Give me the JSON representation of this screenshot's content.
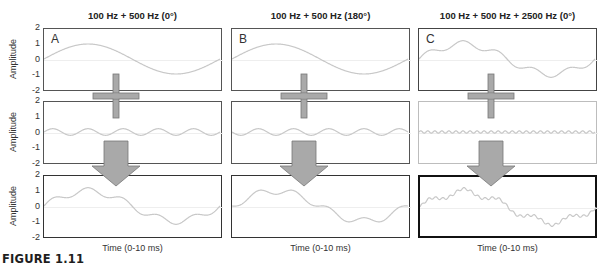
{
  "columns": [
    {
      "title": "100 Hz + 500 Hz (0°)",
      "letter": "A",
      "x_label": "Time (0-10 ms)",
      "rows": [
        {
          "components": [
            {
              "freq": 100,
              "amp": 1.0,
              "phase": 0
            }
          ],
          "border": "#555555"
        },
        {
          "components": [
            {
              "freq": 500,
              "amp": 0.22,
              "phase": 0
            }
          ],
          "border": "#555555"
        },
        {
          "components": [
            {
              "freq": 100,
              "amp": 1.0,
              "phase": 0
            },
            {
              "freq": 500,
              "amp": 0.22,
              "phase": 0
            }
          ],
          "border": "#333333"
        }
      ]
    },
    {
      "title": "100 Hz + 500 Hz (180°)",
      "letter": "B",
      "x_label": "Time (0-10 ms)",
      "rows": [
        {
          "components": [
            {
              "freq": 100,
              "amp": 1.0,
              "phase": 0
            }
          ],
          "border": "#555555"
        },
        {
          "components": [
            {
              "freq": 500,
              "amp": 0.22,
              "phase": 180
            }
          ],
          "border": "#555555"
        },
        {
          "components": [
            {
              "freq": 100,
              "amp": 1.0,
              "phase": 0
            },
            {
              "freq": 500,
              "amp": 0.22,
              "phase": 180
            }
          ],
          "border": "#333333"
        }
      ]
    },
    {
      "title": "100 Hz + 500 Hz + 2500 Hz (0°)",
      "letter": "C",
      "x_label": "Time (0-10 ms)",
      "rows": [
        {
          "components": [
            {
              "freq": 100,
              "amp": 1.0,
              "phase": 0
            },
            {
              "freq": 500,
              "amp": 0.22,
              "phase": 0
            }
          ],
          "border": "#444444"
        },
        {
          "components": [
            {
              "freq": 2500,
              "amp": 0.08,
              "phase": 0
            }
          ],
          "border": "#bdbdbd"
        },
        {
          "components": [
            {
              "freq": 100,
              "amp": 1.0,
              "phase": 0
            },
            {
              "freq": 500,
              "amp": 0.22,
              "phase": 0
            },
            {
              "freq": 2500,
              "amp": 0.08,
              "phase": 0
            }
          ],
          "border": "#111111"
        }
      ]
    }
  ],
  "y_axis": {
    "label": "Amplitude",
    "ticks": [
      "2",
      "1",
      "0",
      "-1",
      "-2"
    ],
    "range": [
      -2,
      2
    ]
  },
  "time_ms": 10,
  "operators": {
    "plus": "plus-sign",
    "result": "down-arrow"
  },
  "colors": {
    "wave": "#c8c8c8",
    "zero_line": "#eeeeee",
    "operator_fill": "#a9a9a9",
    "operator_stroke": "#777777"
  },
  "caption": "FIGURE 1.11",
  "chart_data": {
    "type": "line",
    "xlabel": "Time (0-10 ms)",
    "ylabel": "Amplitude",
    "ylim": [
      -2,
      2
    ],
    "panels": [
      {
        "name": "A",
        "title": "100 Hz + 500 Hz (0°)",
        "series": [
          "100 Hz (amp 1)",
          "500 Hz (amp ~0.2, 0°)",
          "sum"
        ]
      },
      {
        "name": "B",
        "title": "100 Hz + 500 Hz (180°)",
        "series": [
          "100 Hz (amp 1)",
          "500 Hz (amp ~0.2, 180°)",
          "sum"
        ]
      },
      {
        "name": "C",
        "title": "100 Hz + 500 Hz + 2500 Hz (0°)",
        "series": [
          "100 Hz + 500 Hz",
          "2500 Hz (amp ~0.08)",
          "sum"
        ]
      }
    ]
  }
}
